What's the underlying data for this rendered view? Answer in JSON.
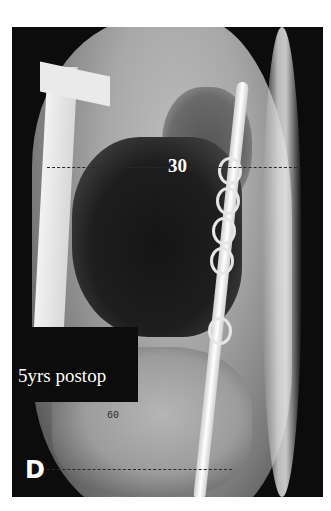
{
  "figure": {
    "panel_label": "D",
    "caption_label": "5yrs postop",
    "angle_upper": "30",
    "angle_lower": "60",
    "colors": {
      "background": "#ffffff",
      "frame": "#0c0c0c",
      "label_text": "#ffffff"
    }
  }
}
